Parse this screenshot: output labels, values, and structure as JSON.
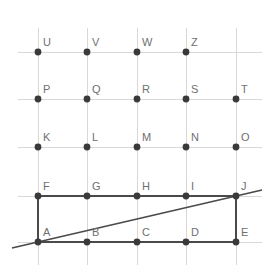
{
  "figure": {
    "background_color": "#ffffff",
    "width": 273,
    "height": 277,
    "grid_color": "#d8d8d8",
    "dot_color": "#3a3a3a",
    "edge_color": "#4a4a4a",
    "label_color": "#6f6f6f"
  },
  "chart_data": {
    "type": "scatter",
    "title": "",
    "xlabel": "",
    "ylabel": "",
    "grid": true,
    "legend": "none",
    "xlim": [
      0,
      273
    ],
    "ylim": [
      277,
      0
    ],
    "column_x": [
      38,
      87,
      137,
      186,
      236
    ],
    "row_y": [
      52,
      99,
      147,
      196,
      242
    ],
    "points": [
      {
        "label": "U",
        "x": 38,
        "y": 52,
        "col": 0,
        "row": 4
      },
      {
        "label": "V",
        "x": 87,
        "y": 52,
        "col": 1,
        "row": 4
      },
      {
        "label": "W",
        "x": 137,
        "y": 52,
        "col": 2,
        "row": 4
      },
      {
        "label": "Z",
        "x": 186,
        "y": 52,
        "col": 3,
        "row": 4
      },
      {
        "label": "P",
        "x": 38,
        "y": 99,
        "col": 0,
        "row": 3
      },
      {
        "label": "Q",
        "x": 87,
        "y": 99,
        "col": 1,
        "row": 3
      },
      {
        "label": "R",
        "x": 137,
        "y": 99,
        "col": 2,
        "row": 3
      },
      {
        "label": "S",
        "x": 186,
        "y": 99,
        "col": 3,
        "row": 3
      },
      {
        "label": "T",
        "x": 236,
        "y": 99,
        "col": 4,
        "row": 3
      },
      {
        "label": "K",
        "x": 38,
        "y": 147,
        "col": 0,
        "row": 2
      },
      {
        "label": "L",
        "x": 87,
        "y": 147,
        "col": 1,
        "row": 2
      },
      {
        "label": "M",
        "x": 137,
        "y": 147,
        "col": 2,
        "row": 2
      },
      {
        "label": "N",
        "x": 186,
        "y": 147,
        "col": 3,
        "row": 2
      },
      {
        "label": "O",
        "x": 236,
        "y": 147,
        "col": 4,
        "row": 2
      },
      {
        "label": "F",
        "x": 38,
        "y": 196,
        "col": 0,
        "row": 1
      },
      {
        "label": "G",
        "x": 87,
        "y": 196,
        "col": 1,
        "row": 1
      },
      {
        "label": "H",
        "x": 137,
        "y": 196,
        "col": 2,
        "row": 1
      },
      {
        "label": "I",
        "x": 186,
        "y": 196,
        "col": 3,
        "row": 1
      },
      {
        "label": "J",
        "x": 236,
        "y": 196,
        "col": 4,
        "row": 1
      },
      {
        "label": "A",
        "x": 38,
        "y": 242,
        "col": 0,
        "row": 0
      },
      {
        "label": "B",
        "x": 87,
        "y": 242,
        "col": 1,
        "row": 0
      },
      {
        "label": "C",
        "x": 137,
        "y": 242,
        "col": 2,
        "row": 0
      },
      {
        "label": "D",
        "x": 186,
        "y": 242,
        "col": 3,
        "row": 0
      },
      {
        "label": "E",
        "x": 236,
        "y": 242,
        "col": 4,
        "row": 0
      }
    ],
    "grid_lines": {
      "horizontal": [
        {
          "y": 52,
          "x1": 18,
          "x2": 262
        },
        {
          "y": 99,
          "x1": 18,
          "x2": 262
        },
        {
          "y": 147,
          "x1": 18,
          "x2": 262
        },
        {
          "y": 196,
          "x1": 18,
          "x2": 262
        },
        {
          "y": 242,
          "x1": 18,
          "x2": 262
        }
      ],
      "vertical": [
        {
          "x": 38,
          "y1": 28,
          "y2": 265
        },
        {
          "x": 87,
          "y1": 28,
          "y2": 265
        },
        {
          "x": 137,
          "y1": 28,
          "y2": 265
        },
        {
          "x": 186,
          "y1": 28,
          "y2": 265
        },
        {
          "x": 236,
          "y1": 28,
          "y2": 265
        }
      ]
    },
    "rectangle": {
      "name": "rectangle-AFJE",
      "vertices": [
        "A",
        "F",
        "J",
        "E"
      ],
      "x": 38,
      "y": 196,
      "width": 198,
      "height": 46
    },
    "diagonal": {
      "name": "diagonal-AJ",
      "through": [
        "A",
        "J"
      ],
      "x1": 12,
      "y1": 248,
      "x2": 262,
      "y2": 190
    }
  }
}
